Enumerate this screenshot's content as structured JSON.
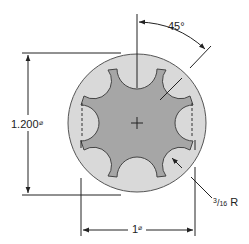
{
  "drawing": {
    "title": "Scalloped shaft cross-section",
    "dimensions": {
      "angle": {
        "value": "45",
        "unit": "°",
        "label": "45°"
      },
      "outer_diameter": {
        "value": "1.200",
        "symbol": "⌀"
      },
      "inner_diameter": {
        "value": "1",
        "symbol": "⌀"
      },
      "scallop_radius": {
        "numerator": "3",
        "denominator": "16",
        "suffix": "R"
      }
    },
    "scallop_count": 8
  },
  "colors": {
    "outer_fill": "#d9d9d9",
    "inner_fill": "#a6a6a6",
    "line": "#333333",
    "background": "#ffffff"
  }
}
